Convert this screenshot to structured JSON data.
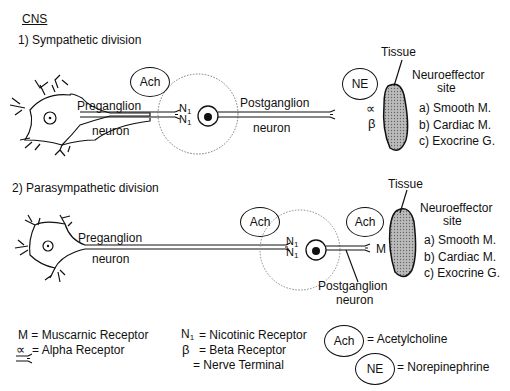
{
  "header": {
    "title": "CNS"
  },
  "sympathetic": {
    "heading": "1) Sympathetic division",
    "neurotransmitter_pre": "Ach",
    "neurotransmitter_post": "NE",
    "pre_label_1": "Preganglion",
    "pre_label_2": "neuron",
    "ganglion_receptor": "N",
    "ganglion_receptor_sub": "1",
    "post_label_1": "Postganglion",
    "post_label_2": "neuron",
    "effector_receptor_1": "∝",
    "effector_receptor_2": "β",
    "tissue_label": "Tissue",
    "site_label_1": "Neuroeffector",
    "site_label_2": "site",
    "targets": [
      "a) Smooth M.",
      "b) Cardiac M.",
      "c) Exocrine G."
    ]
  },
  "parasympathetic": {
    "heading": "2) Parasympathetic division",
    "neurotransmitter_pre": "Ach",
    "neurotransmitter_post": "Ach",
    "pre_label_1": "Preganglion",
    "pre_label_2": "neuron",
    "ganglion_receptor": "N",
    "ganglion_receptor_sub": "1",
    "post_label_1": "Postganglion",
    "post_label_2": "neuron",
    "effector_receptor": "M",
    "tissue_label": "Tissue",
    "site_label_1": "Neuroeffector",
    "site_label_2": "site",
    "targets": [
      "a) Smooth M.",
      "b) Cardiac M.",
      "c) Exocrine G."
    ]
  },
  "legend": {
    "m": "M = Muscarnic Receptor",
    "alpha_sym": "∝",
    "alpha": "= Alpha Receptor",
    "n_sym": "N",
    "n_sub": "1",
    "n": "= Nicotinic Receptor",
    "beta_sym": "β",
    "beta": "= Beta Receptor",
    "terminal": "= Nerve Terminal",
    "ach_sym": "Ach",
    "ach": "= Acetylcholine",
    "ne_sym": "NE",
    "ne": "= Norepinephrine"
  }
}
